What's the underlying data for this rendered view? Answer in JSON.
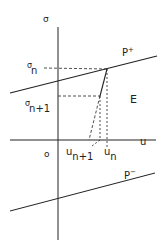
{
  "diagram": {
    "axes": {
      "vertical_label": "σ",
      "horizontal_label": "u",
      "origin_label": "o"
    },
    "lines": {
      "upper_label": "P",
      "upper_sup": "+",
      "lower_label": "P",
      "lower_sup": "−"
    },
    "region_label": "E",
    "stress_labels": {
      "sigma_n_base": "σ",
      "sigma_n_sub": "n",
      "sigma_n1_base": "σ",
      "sigma_n1_sub": "n+1"
    },
    "disp_labels": {
      "u_n1_base": "u",
      "u_n1_sub": "n+1",
      "u_n_base": "u",
      "u_n_sub": "n"
    },
    "colors": {
      "stroke": "#222222",
      "background": "#ffffff"
    }
  }
}
